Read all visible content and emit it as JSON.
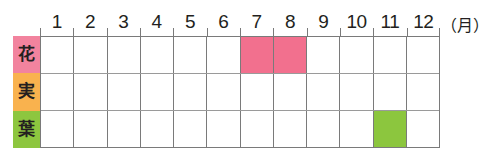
{
  "chart_data": {
    "type": "heatmap",
    "title": "",
    "xlabel": "月",
    "ylabel": "",
    "unit_note": "（月）",
    "categories": [
      "1",
      "2",
      "3",
      "4",
      "5",
      "6",
      "7",
      "8",
      "9",
      "10",
      "11",
      "12"
    ],
    "rows": [
      {
        "name": "花",
        "label_color": "#f2839e",
        "fill_color": "#f2708e",
        "values": [
          0,
          0,
          0,
          0,
          0,
          0,
          1,
          1,
          0,
          0,
          0,
          0
        ]
      },
      {
        "name": "実",
        "label_color": "#f9b24e",
        "fill_color": "#f9a93a",
        "values": [
          0,
          0,
          0,
          0,
          0,
          0,
          0,
          0,
          0,
          0,
          0,
          0
        ]
      },
      {
        "name": "葉",
        "label_color": "#8dc63f",
        "fill_color": "#8cc63e",
        "values": [
          0,
          0,
          0,
          0,
          0,
          0,
          0,
          0,
          0,
          0,
          1,
          0
        ]
      }
    ],
    "grid": true,
    "legend": "none"
  },
  "colors": {
    "flower_pink": "#f2708e",
    "fruit_orange": "#f9a93a",
    "leaf_green": "#8cc63e",
    "grid_line": "#7a7a7a",
    "text": "#231f20",
    "background": "#ffffff"
  }
}
